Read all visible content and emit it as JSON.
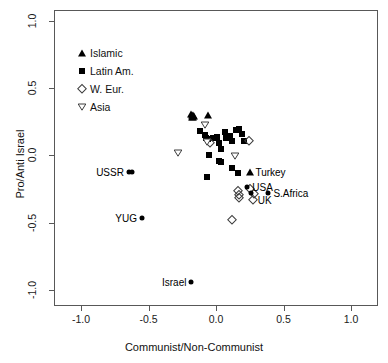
{
  "chart_data": {
    "type": "scatter",
    "title": "",
    "xlabel": "Communist/Non-Communist",
    "ylabel": "Pro/Anti Israel",
    "xlim": [
      -1.2,
      1.2
    ],
    "ylim": [
      -1.12,
      1.08
    ],
    "xticks": [
      "-1.0",
      "-0.5",
      "0.0",
      "0.5",
      "1.0"
    ],
    "xtick_values": [
      -1.0,
      -0.5,
      0.0,
      0.5,
      1.0
    ],
    "yticks": [
      "-1.0",
      "-0.5",
      "0.0",
      "0.5",
      "1.0"
    ],
    "ytick_values": [
      -1.0,
      -0.5,
      0.0,
      0.5,
      1.0
    ],
    "grid": false,
    "legend_position": "upper left",
    "legend": [
      {
        "label": "Islamic",
        "marker": "filled-triangle-up"
      },
      {
        "label": "Latin Am.",
        "marker": "filled-square"
      },
      {
        "label": "W. Eur.",
        "marker": "open-diamond"
      },
      {
        "label": "Asia",
        "marker": "open-triangle-down"
      }
    ],
    "series": [
      {
        "name": "Islamic",
        "marker": "filled-triangle-up",
        "points": [
          {
            "x": -0.185,
            "y": 0.305
          },
          {
            "x": -0.175,
            "y": 0.3
          },
          {
            "x": -0.168,
            "y": 0.296
          },
          {
            "x": -0.16,
            "y": 0.292
          },
          {
            "x": -0.178,
            "y": 0.288
          },
          {
            "x": -0.17,
            "y": 0.283
          },
          {
            "x": -0.06,
            "y": 0.302
          },
          {
            "x": 0.255,
            "y": -0.125,
            "label": "Turkey",
            "label_side": "right"
          }
        ]
      },
      {
        "name": "Latin Am.",
        "marker": "filled-square",
        "points": [
          {
            "x": -0.12,
            "y": 0.178
          },
          {
            "x": -0.085,
            "y": 0.148
          },
          {
            "x": -0.075,
            "y": 0.13
          },
          {
            "x": -0.06,
            "y": 0.12
          },
          {
            "x": -0.02,
            "y": 0.13
          },
          {
            "x": 0.005,
            "y": 0.133
          },
          {
            "x": 0.068,
            "y": 0.172
          },
          {
            "x": 0.1,
            "y": 0.14
          },
          {
            "x": 0.118,
            "y": 0.108
          },
          {
            "x": 0.15,
            "y": 0.19
          },
          {
            "x": 0.172,
            "y": 0.197
          },
          {
            "x": 0.195,
            "y": 0.155
          },
          {
            "x": 0.205,
            "y": 0.11
          },
          {
            "x": 0.04,
            "y": 0.048
          },
          {
            "x": 0.075,
            "y": 0.128
          },
          {
            "x": 0.02,
            "y": 0.092
          },
          {
            "x": -0.05,
            "y": 0.0
          },
          {
            "x": 0.02,
            "y": -0.04
          },
          {
            "x": 0.04,
            "y": -0.048
          },
          {
            "x": 0.115,
            "y": -0.098
          },
          {
            "x": -0.065,
            "y": -0.158
          },
          {
            "x": 0.16,
            "y": -0.128
          }
        ]
      },
      {
        "name": "W. Eur.",
        "marker": "open-diamond",
        "points": [
          {
            "x": 0.248,
            "y": 0.104
          },
          {
            "x": -0.045,
            "y": 0.092
          },
          {
            "x": 0.163,
            "y": -0.268
          },
          {
            "x": 0.168,
            "y": -0.295
          },
          {
            "x": 0.172,
            "y": -0.315
          },
          {
            "x": 0.255,
            "y": -0.248
          },
          {
            "x": 0.282,
            "y": -0.29
          },
          {
            "x": 0.272,
            "y": -0.33,
            "label": "UK",
            "label_side": "right"
          },
          {
            "x": 0.122,
            "y": -0.482
          }
        ]
      },
      {
        "name": "Asia",
        "marker": "open-triangle-down",
        "points": [
          {
            "x": -0.285,
            "y": 0.018
          },
          {
            "x": -0.085,
            "y": 0.222
          },
          {
            "x": -0.068,
            "y": 0.096
          },
          {
            "x": 0.138,
            "y": -0.005
          }
        ]
      },
      {
        "name": "Labeled",
        "marker": "filled-circle",
        "points": [
          {
            "x": -0.645,
            "y": -0.125,
            "label": "USSR",
            "label_side": "left"
          },
          {
            "x": -0.622,
            "y": -0.125
          },
          {
            "x": -0.548,
            "y": -0.468,
            "label": "YUG",
            "label_side": "left"
          },
          {
            "x": -0.182,
            "y": -0.938,
            "label": "Israel",
            "label_side": "left"
          },
          {
            "x": 0.232,
            "y": -0.232,
            "label": "USA",
            "label_side": "right"
          },
          {
            "x": 0.262,
            "y": -0.278
          },
          {
            "x": 0.388,
            "y": -0.282,
            "label": "S.Africa",
            "label_side": "right"
          }
        ]
      }
    ]
  }
}
